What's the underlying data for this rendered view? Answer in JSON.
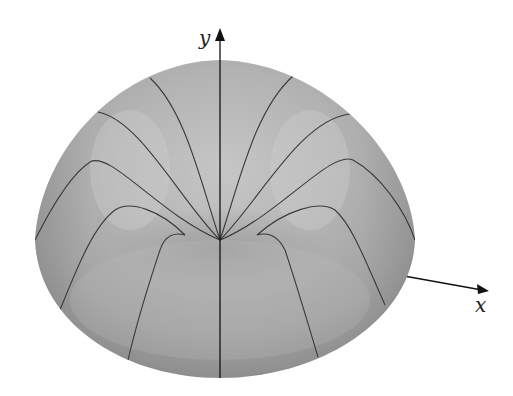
{
  "figure": {
    "axes": {
      "y_label": "y",
      "x_label": "x"
    },
    "colors": {
      "surface_light": "#c9c9c9",
      "surface_mid": "#a8a8a8",
      "surface_dark": "#8e8e8e",
      "meridian": "#3a3a3a",
      "axis": "#111111",
      "background": "#ffffff"
    },
    "meridian_count": 12
  }
}
